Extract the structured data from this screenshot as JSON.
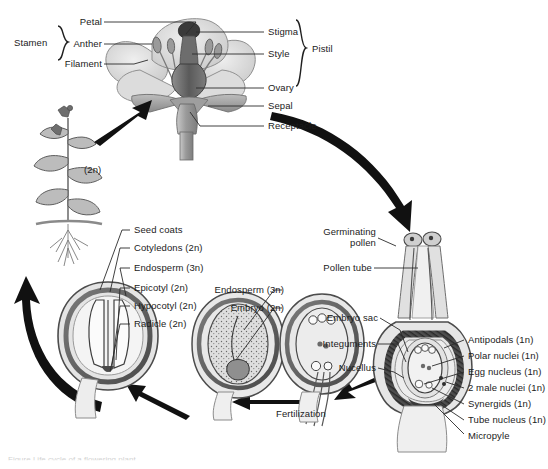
{
  "figure": {
    "caption_fragment": "Figure  Life cycle of a flowering plant"
  },
  "flower": {
    "bracket_left_label": "Stamen",
    "bracket_right_label": "Pistil",
    "labels_left": [
      {
        "key": "petal",
        "text": "Petal"
      },
      {
        "key": "anther",
        "text": "Anther"
      },
      {
        "key": "filament",
        "text": "Filament"
      }
    ],
    "labels_right": [
      {
        "key": "stigma",
        "text": "Stigma"
      },
      {
        "key": "style",
        "text": "Style"
      },
      {
        "key": "ovary",
        "text": "Ovary"
      },
      {
        "key": "sepal",
        "text": "Sepal"
      },
      {
        "key": "receptacle",
        "text": "Receptacle"
      }
    ]
  },
  "sporophyte": {
    "ploidy_label": "(2n)"
  },
  "seed": {
    "labels": [
      {
        "key": "seed-coats",
        "text": "Seed coats"
      },
      {
        "key": "cotyledons",
        "text": "Cotyledons (2n)"
      },
      {
        "key": "endosperm",
        "text": "Endosperm (3n)"
      },
      {
        "key": "epicotyl",
        "text": "Epicotyl (2n)"
      },
      {
        "key": "hypocotyl",
        "text": "Hypocotyl (2n)"
      },
      {
        "key": "radicle",
        "text": "Radicle (2n)"
      }
    ]
  },
  "developing_seed": {
    "labels": [
      {
        "key": "endosperm-3n",
        "text": "Endosperm (3n)"
      },
      {
        "key": "embryo-2n",
        "text": "Embryo (2n)"
      }
    ]
  },
  "fertilization": {
    "label": "Fertilization"
  },
  "pollination": {
    "labels": [
      {
        "key": "germinating-pollen",
        "text": "Germinating\npollen"
      },
      {
        "key": "germinating-pollen-line1",
        "text": "Germinating"
      },
      {
        "key": "germinating-pollen-line2",
        "text": "pollen"
      },
      {
        "key": "pollen-tube",
        "text": "Pollen tube"
      },
      {
        "key": "embryo-sac",
        "text": "Embryo sac"
      },
      {
        "key": "integuments",
        "text": "Integuments"
      },
      {
        "key": "nucellus",
        "text": "Nucellus"
      }
    ]
  },
  "embryo_sac": {
    "labels": [
      {
        "key": "antipodals",
        "text": "Antipodals (1n)"
      },
      {
        "key": "polar-nuclei",
        "text": "Polar nuclei (1n)"
      },
      {
        "key": "egg-nucleus",
        "text": "Egg nucleus (1n)"
      },
      {
        "key": "two-male-nuclei",
        "text": "2 male nuclei (1n)"
      },
      {
        "key": "synergids",
        "text": "Synergids (1n)"
      },
      {
        "key": "tube-nucleus",
        "text": "Tube nucleus (1n)"
      },
      {
        "key": "micropyle",
        "text": "Micropyle"
      }
    ]
  },
  "colors": {
    "ink": "#1a1a1a",
    "leader": "#2b2b2b",
    "tissue_light": "#d8d8d8",
    "tissue_mid": "#a8a8a8",
    "tissue_dark": "#6e6e6e",
    "tissue_darkest": "#3c3c3c",
    "background": "#ffffff"
  }
}
